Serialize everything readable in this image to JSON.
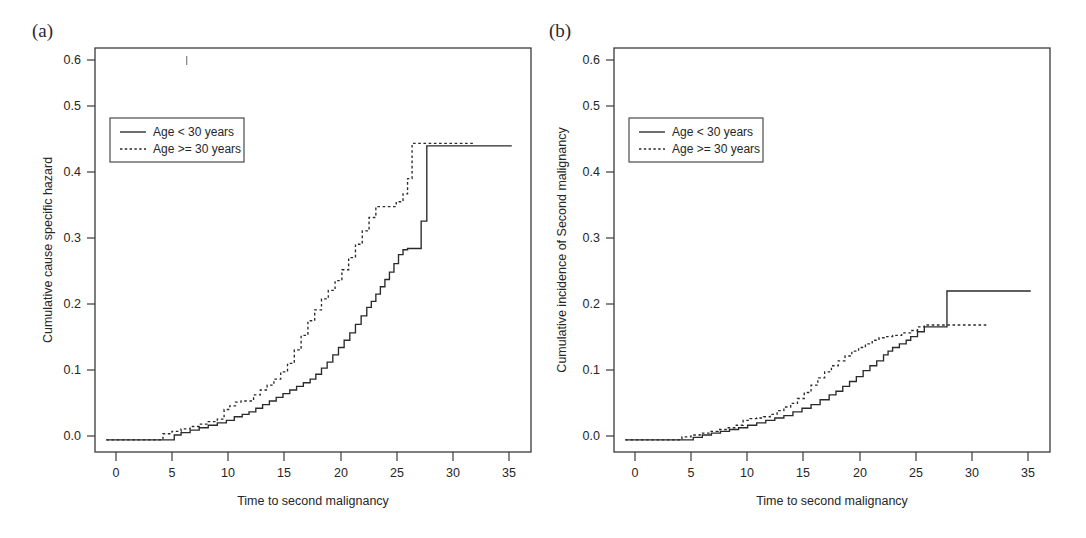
{
  "figure": {
    "background_color": "#ffffff",
    "ink_color": "#2a2a2a",
    "panels": [
      {
        "id": "a",
        "label": "(a)",
        "title": "",
        "xlabel": "Time to second malignancy",
        "ylabel": "Cumulative cause specific hazard",
        "xticks": [
          "0",
          "5",
          "10",
          "15",
          "20",
          "25",
          "30",
          "35"
        ],
        "yticks": [
          "0.0",
          "0.1",
          "0.2",
          "0.3",
          "0.4",
          "0.5",
          "0.6"
        ],
        "legend": {
          "entries": [
            {
              "label": "Age < 30 years",
              "style": "solid"
            },
            {
              "label": "Age >= 30 years",
              "style": "dotted"
            }
          ]
        }
      },
      {
        "id": "b",
        "label": "(b)",
        "title": "",
        "xlabel": "Time to second malignancy",
        "ylabel": "Cumulative incidence of Second malignancy",
        "xticks": [
          "0",
          "5",
          "10",
          "15",
          "20",
          "25",
          "30",
          "35"
        ],
        "yticks": [
          "0.0",
          "0.1",
          "0.2",
          "0.3",
          "0.4",
          "0.5",
          "0.6"
        ],
        "legend": {
          "entries": [
            {
              "label": "Age < 30 years",
              "style": "solid"
            },
            {
              "label": "Age >= 30 years",
              "style": "dotted"
            }
          ]
        }
      }
    ]
  },
  "chart_data": [
    {
      "type": "line",
      "subplot": "a",
      "title": "",
      "xlabel": "Time to second malignancy",
      "ylabel": "Cumulative cause specific hazard",
      "xlim": [
        -1.0,
        37.5
      ],
      "ylim": [
        -0.02,
        0.645
      ],
      "xticks": [
        0,
        5,
        10,
        15,
        20,
        25,
        30,
        35
      ],
      "yticks": [
        0.0,
        0.1,
        0.2,
        0.3,
        0.4,
        0.5,
        0.6
      ],
      "grid": false,
      "legend_position": "upper left",
      "step_type": "post",
      "series": [
        {
          "name": "Age < 30 years",
          "style": "solid",
          "x": [
            0,
            5.2,
            6.0,
            6.6,
            7.4,
            8.2,
            9.0,
            9.8,
            10.6,
            11.3,
            12.0,
            12.6,
            13.2,
            13.8,
            14.4,
            15.0,
            15.6,
            16.2,
            16.8,
            17.4,
            18.0,
            18.5,
            19.0,
            19.5,
            20.0,
            20.5,
            21.0,
            21.5,
            22.0,
            22.5,
            23.0,
            23.4,
            23.8,
            24.2,
            24.6,
            25.0,
            25.4,
            25.8,
            26.2,
            26.6,
            27.8,
            28.3,
            35.8
          ],
          "y": [
            0.0,
            0.0,
            0.008,
            0.012,
            0.016,
            0.02,
            0.024,
            0.028,
            0.032,
            0.038,
            0.042,
            0.046,
            0.052,
            0.058,
            0.064,
            0.07,
            0.076,
            0.082,
            0.088,
            0.094,
            0.1,
            0.108,
            0.118,
            0.128,
            0.14,
            0.152,
            0.164,
            0.176,
            0.19,
            0.204,
            0.218,
            0.228,
            0.24,
            0.252,
            0.264,
            0.276,
            0.29,
            0.305,
            0.313,
            0.315,
            0.36,
            0.484,
            0.484
          ]
        },
        {
          "name": "Age >= 30 years",
          "style": "dotted",
          "x": [
            0,
            4.2,
            5.0,
            5.8,
            6.6,
            7.4,
            8.2,
            9.0,
            9.8,
            10.4,
            10.9,
            11.4,
            11.9,
            12.4,
            13.0,
            13.6,
            14.2,
            14.8,
            15.4,
            16.0,
            16.6,
            17.2,
            17.8,
            18.4,
            19.0,
            19.6,
            20.2,
            20.8,
            21.4,
            22.0,
            22.6,
            23.2,
            23.8,
            25.0,
            25.6,
            26.2,
            26.6,
            27.0,
            32.5
          ],
          "y": [
            0.0,
            0.0,
            0.01,
            0.014,
            0.018,
            0.022,
            0.026,
            0.03,
            0.034,
            0.05,
            0.056,
            0.062,
            0.064,
            0.064,
            0.074,
            0.082,
            0.09,
            0.1,
            0.112,
            0.126,
            0.148,
            0.172,
            0.196,
            0.214,
            0.232,
            0.246,
            0.262,
            0.28,
            0.3,
            0.322,
            0.344,
            0.366,
            0.384,
            0.384,
            0.392,
            0.405,
            0.43,
            0.488,
            0.488
          ]
        }
      ]
    },
    {
      "type": "line",
      "subplot": "b",
      "title": "",
      "xlabel": "Time to second malignancy",
      "ylabel": "Cumulative incidence of Second malignancy",
      "xlim": [
        -1.0,
        37.5
      ],
      "ylim": [
        -0.02,
        0.645
      ],
      "xticks": [
        0,
        5,
        10,
        15,
        20,
        25,
        30,
        35
      ],
      "yticks": [
        0.0,
        0.1,
        0.2,
        0.3,
        0.4,
        0.5,
        0.6
      ],
      "grid": false,
      "legend_position": "upper left",
      "step_type": "post",
      "series": [
        {
          "name": "Age < 30 years",
          "style": "solid",
          "x": [
            0,
            5.2,
            6.0,
            6.8,
            7.6,
            8.4,
            9.2,
            10.0,
            10.8,
            11.6,
            12.4,
            13.2,
            14.0,
            14.8,
            15.6,
            16.4,
            17.2,
            18.0,
            18.6,
            19.2,
            19.8,
            20.4,
            21.0,
            21.6,
            22.2,
            22.8,
            23.2,
            23.6,
            24.2,
            24.8,
            25.2,
            25.8,
            26.4,
            28.4,
            35.8
          ],
          "y": [
            0.0,
            0.0,
            0.004,
            0.008,
            0.011,
            0.014,
            0.017,
            0.02,
            0.024,
            0.028,
            0.032,
            0.036,
            0.04,
            0.046,
            0.052,
            0.058,
            0.066,
            0.074,
            0.08,
            0.088,
            0.096,
            0.104,
            0.114,
            0.122,
            0.13,
            0.14,
            0.146,
            0.152,
            0.158,
            0.164,
            0.17,
            0.178,
            0.186,
            0.245,
            0.245
          ]
        },
        {
          "name": "Age >= 30 years",
          "style": "dotted",
          "x": [
            0,
            4.2,
            5.0,
            5.8,
            6.6,
            7.4,
            8.2,
            9.0,
            9.8,
            10.4,
            11.0,
            11.6,
            12.2,
            12.8,
            13.4,
            14.0,
            14.6,
            15.2,
            15.8,
            16.4,
            17.0,
            17.6,
            18.2,
            18.8,
            19.4,
            20.0,
            20.6,
            21.2,
            21.8,
            22.4,
            23.0,
            23.6,
            24.4,
            25.2,
            25.8,
            26.4,
            32.0
          ],
          "y": [
            0.0,
            0.0,
            0.005,
            0.008,
            0.011,
            0.014,
            0.017,
            0.02,
            0.024,
            0.032,
            0.035,
            0.036,
            0.038,
            0.042,
            0.048,
            0.054,
            0.06,
            0.068,
            0.078,
            0.09,
            0.102,
            0.112,
            0.122,
            0.13,
            0.138,
            0.146,
            0.152,
            0.158,
            0.164,
            0.168,
            0.17,
            0.172,
            0.176,
            0.18,
            0.186,
            0.189,
            0.189
          ]
        }
      ]
    }
  ]
}
